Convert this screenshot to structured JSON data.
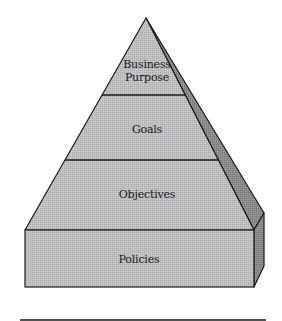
{
  "diagram": {
    "type": "pyramid",
    "levels": [
      {
        "label_line1": "Business",
        "label_line2": "Purpose",
        "position": "top"
      },
      {
        "label": "Goals",
        "position": "upper-middle"
      },
      {
        "label": "Objectives",
        "position": "lower-middle"
      },
      {
        "label": "Policies",
        "position": "base"
      }
    ],
    "colors": {
      "front_face": "#bdbdbd",
      "side_face": "#8a8a8a",
      "outline": "#1a1a1a",
      "background": "#ffffff"
    }
  }
}
